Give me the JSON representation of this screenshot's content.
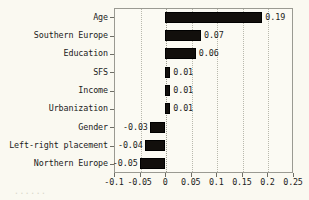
{
  "chart_data": {
    "type": "bar",
    "orientation": "horizontal",
    "title": "",
    "xlabel": "",
    "ylabel": "",
    "categories": [
      "Age",
      "Southern Europe",
      "Education",
      "SFS",
      "Income",
      "Urbanization",
      "Gender",
      "Left-right placement",
      "Northern Europe"
    ],
    "values": [
      0.19,
      0.07,
      0.06,
      0.01,
      0.01,
      0.01,
      -0.03,
      -0.04,
      -0.05
    ],
    "value_labels": [
      "0.19",
      "0.07",
      "0.06",
      "0.01",
      "0.01",
      "0.01",
      "-0.03",
      "-0.04",
      "-0.05"
    ],
    "xlim": [
      -0.1,
      0.25
    ],
    "xticks": [
      -0.1,
      -0.05,
      0,
      0.05,
      0.1,
      0.15,
      0.2,
      0.25
    ],
    "xtick_labels": [
      "-0.1",
      "-0.05",
      "0",
      "0.05",
      "0.1",
      "0.15",
      "0.2",
      "0.25"
    ],
    "grid": true,
    "grid_axis": "x",
    "grid_style": "dotted",
    "legend": null,
    "bar_color": "#120f0c",
    "background_color": "#faf9f1",
    "frame_color": "#9a9a92",
    "gridline_color": "#b9b9ad"
  },
  "caption": {
    "clipped_text": "......"
  }
}
